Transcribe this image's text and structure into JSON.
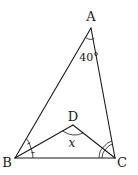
{
  "diagram": {
    "type": "geometry-triangle",
    "vertices": {
      "A": "A",
      "B": "B",
      "C": "C",
      "D": "D"
    },
    "segments": [
      "AB",
      "AC",
      "BC",
      "BD",
      "CD"
    ],
    "angle_labels": {
      "angle_A": "40°",
      "angle_BDC": "x"
    },
    "markings": {
      "angle_B": "single arc marks — BD bisects angle ABC",
      "angle_C": "double arc marks — CD bisects angle ACB"
    }
  }
}
